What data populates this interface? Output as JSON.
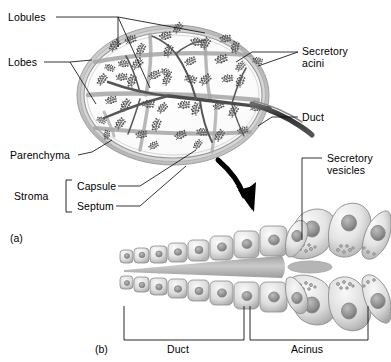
{
  "figure": {
    "panels": [
      {
        "id": "a",
        "caption": "(a)",
        "description": "Whole gland in section"
      },
      {
        "id": "b",
        "caption": "(b)",
        "description": "Magnified duct and acinus"
      }
    ]
  },
  "labels": {
    "lobules": "Lobules",
    "lobes": "Lobes",
    "parenchyma": "Parenchyma",
    "stroma": "Stroma",
    "capsule": "Capsule",
    "septum": "Septum",
    "secretory_acini_line1": "Secretory",
    "secretory_acini_line2": "acini",
    "duct_right": "Duct",
    "secretory_vesicles_line1": "Secretory",
    "secretory_vesicles_line2": "vesicles",
    "duct_bracket": "Duct",
    "acinus_bracket": "Acinus"
  },
  "panel_captions": {
    "a": "(a)",
    "b": "(b)"
  },
  "colors": {
    "ink": "#111111",
    "capsule_gray": "#b9b9b9",
    "septum_gray": "#9a9a9a",
    "duct_dark": "#3a3a3a",
    "cell_fill": "#e9e9e9",
    "cell_shade": "#b5b5b5",
    "nucleus": "#8f8f8f",
    "lumen": "#a8a8a8",
    "background": "#ffffff",
    "arrow": "#000000"
  },
  "graphic": {
    "gland": {
      "shape": "oval sectioned gland",
      "lobe_count": 5,
      "acini_clusters": "branching feathery acinar tufts",
      "duct_exit": "right side"
    },
    "magnified": {
      "duct_cell_rows": 2,
      "duct_cells_per_row": 8,
      "acinus_cell_count": 9,
      "arrow": "curved black arrow from gland to acinus"
    }
  }
}
